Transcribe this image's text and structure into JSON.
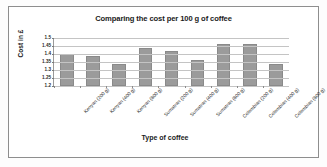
{
  "chart_data": {
    "type": "bar",
    "title": "Comparing the cost per 100 g of coffee",
    "xlabel": "Type of coffee",
    "ylabel": "Cost in £",
    "categories": [
      "Kenyan (200 g)",
      "Kenyan (400 g)",
      "Kenyan (800 g)",
      "Sumatran (200 g)",
      "Sumatran (400 g)",
      "Sumatran (800 g)",
      "Colombian (200 g)",
      "Colombian (400 g)",
      "Colombian (800 g)"
    ],
    "values": [
      1.4,
      1.39,
      1.34,
      1.44,
      1.42,
      1.36,
      1.46,
      1.46,
      1.34
    ],
    "ylim": [
      1.2,
      1.5
    ],
    "ytick_labels": [
      "1.2",
      "1.25",
      "1.3",
      "1.35",
      "1.4",
      "1.45",
      "1.5"
    ],
    "ytick_values": [
      1.2,
      1.25,
      1.3,
      1.35,
      1.4,
      1.45,
      1.5
    ],
    "grid": true,
    "legend": false,
    "bar_color": "#9b9b9b",
    "gridline_color": "#c4c4c4",
    "axis_color": "#6f6f6f",
    "background_color": "#ffffff"
  }
}
